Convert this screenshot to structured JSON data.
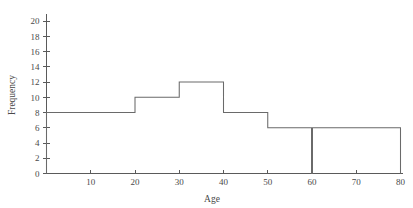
{
  "chart_data": {
    "type": "bar",
    "title": "",
    "subtitle": "",
    "xlabel": "Age",
    "ylabel": "Frequency",
    "xlim": [
      0,
      80
    ],
    "ylim": [
      0,
      21
    ],
    "grid": false,
    "legend": null,
    "style": {
      "line_color": "#5f5f5f",
      "bar_fill": "none",
      "text_color": "#4a4a4a",
      "background": "#ffffff"
    },
    "x_ticks": [
      10,
      20,
      30,
      40,
      50,
      60,
      70,
      80
    ],
    "x_tick_labels": [
      "10",
      "20",
      "30",
      "40",
      "50",
      "60",
      "70",
      "80"
    ],
    "y_ticks": [
      0,
      2,
      4,
      6,
      8,
      10,
      12,
      14,
      16,
      18,
      20
    ],
    "y_tick_labels": [
      "0",
      "2",
      "4",
      "6",
      "8",
      "10",
      "12",
      "14",
      "16",
      "18",
      "20"
    ],
    "bins": [
      {
        "label": "0-20",
        "x_start": 0,
        "x_end": 20,
        "frequency": 8
      },
      {
        "label": "20-30",
        "x_start": 20,
        "x_end": 30,
        "frequency": 10
      },
      {
        "label": "30-40",
        "x_start": 30,
        "x_end": 40,
        "frequency": 12
      },
      {
        "label": "40-50",
        "x_start": 40,
        "x_end": 50,
        "frequency": 8
      },
      {
        "label": "50-60",
        "x_start": 50,
        "x_end": 60,
        "frequency": 6
      },
      {
        "label": "60-80",
        "x_start": 60,
        "x_end": 80,
        "frequency": 6
      }
    ],
    "categories": [
      "0-20",
      "20-30",
      "30-40",
      "40-50",
      "50-60",
      "60-80"
    ],
    "values": [
      8,
      10,
      12,
      8,
      6,
      6
    ]
  }
}
